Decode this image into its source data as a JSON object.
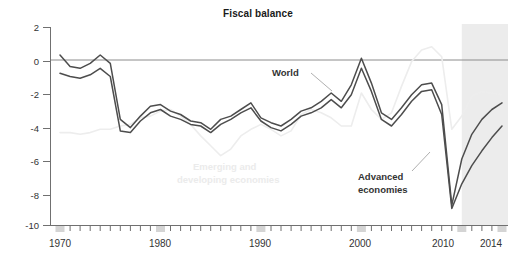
{
  "chart_data": {
    "type": "line",
    "title": "Fiscal balance",
    "xlabel": "",
    "ylabel": "",
    "xlim": [
      1969,
      2014.6
    ],
    "ylim": [
      -10,
      2
    ],
    "yticks": [
      2,
      0,
      -2,
      -4,
      -6,
      -8,
      -10
    ],
    "ytick_labels": [
      "2",
      "0",
      "-2",
      "-4",
      "-6",
      "-8",
      "-10"
    ],
    "xticks": [
      1970,
      1980,
      1990,
      2000,
      2010,
      2014
    ],
    "xtick_labels": [
      "1970",
      "1980",
      "1990",
      "2000",
      "2010",
      "2014"
    ],
    "minor_tick_interval": 1,
    "grid": false,
    "legend_position": "inline-annotations",
    "zero_line": 0,
    "projection_start": 2010,
    "projection_end": 2014.6,
    "projection_shading": "#ececec",
    "colors": {
      "world": "#4d4d4d",
      "advanced": "#4d4d4d",
      "emerging": "#ededed",
      "axis": "#707070",
      "zero_line": "#8c8c8c",
      "projection_band": "#ececec",
      "text": "#333333"
    },
    "x": [
      1970,
      1971,
      1972,
      1973,
      1974,
      1975,
      1976,
      1977,
      1978,
      1979,
      1980,
      1981,
      1982,
      1983,
      1984,
      1985,
      1986,
      1987,
      1988,
      1989,
      1990,
      1991,
      1992,
      1993,
      1994,
      1995,
      1996,
      1997,
      1998,
      1999,
      2000,
      2001,
      2002,
      2003,
      2004,
      2005,
      2006,
      2007,
      2008,
      2009,
      2010,
      2011,
      2012,
      2013,
      2014
    ],
    "series": [
      {
        "name": "World",
        "label": "World",
        "color": "#4d4d4d",
        "values": [
          0.3,
          -0.4,
          -0.5,
          -0.2,
          0.3,
          -0.2,
          -3.6,
          -4.1,
          -3.4,
          -2.8,
          -2.7,
          -3.1,
          -3.3,
          -3.7,
          -3.8,
          -4.2,
          -3.6,
          -3.4,
          -3.0,
          -2.6,
          -3.5,
          -3.8,
          -4.0,
          -3.6,
          -3.1,
          -2.9,
          -2.5,
          -2.0,
          -2.5,
          -1.5,
          0.1,
          -1.4,
          -3.2,
          -3.6,
          -2.9,
          -2.1,
          -1.5,
          -1.4,
          -2.7,
          -8.8,
          -6.0,
          -4.5,
          -3.6,
          -3.0,
          -2.6
        ]
      },
      {
        "name": "Advanced economies",
        "label": "Advanced\neconomies",
        "color": "#4d4d4d",
        "values": [
          -0.8,
          -1.0,
          -1.1,
          -0.9,
          -0.5,
          -1.0,
          -4.3,
          -4.4,
          -3.7,
          -3.2,
          -3.0,
          -3.4,
          -3.6,
          -3.9,
          -4.0,
          -4.4,
          -3.9,
          -3.6,
          -3.2,
          -2.9,
          -3.7,
          -4.1,
          -4.3,
          -3.9,
          -3.4,
          -3.2,
          -2.9,
          -2.4,
          -2.9,
          -2.1,
          -0.5,
          -1.9,
          -3.6,
          -4.0,
          -3.3,
          -2.5,
          -1.9,
          -1.8,
          -3.3,
          -9.0,
          -7.5,
          -6.4,
          -5.5,
          -4.7,
          -4.0
        ]
      },
      {
        "name": "Emerging and developing economies",
        "label": "Emerging and\ndeveloping economies",
        "color": "#ededed",
        "values": [
          -4.4,
          -4.4,
          -4.5,
          -4.4,
          -4.2,
          -4.2,
          -4.0,
          -3.9,
          -3.5,
          -3.4,
          -3.1,
          -3.0,
          -3.4,
          -3.9,
          -4.6,
          -5.2,
          -5.8,
          -5.4,
          -4.6,
          -4.2,
          -3.9,
          -4.2,
          -4.6,
          -4.3,
          -3.3,
          -3.0,
          -3.2,
          -3.5,
          -4.0,
          -4.0,
          -2.0,
          -3.0,
          -3.6,
          -3.2,
          -1.6,
          -0.1,
          0.6,
          0.8,
          0.2,
          -4.2,
          -3.4,
          -2.2,
          -1.9,
          -2.0,
          -2.1
        ]
      }
    ],
    "annotations": [
      {
        "text": "World",
        "x": 2000.4,
        "y": -1.2,
        "style": "dark"
      },
      {
        "text": "Advanced economies",
        "x": 2005.0,
        "y": -7.2,
        "style": "dark"
      },
      {
        "text": "Emerging and developing economies",
        "x": 1986.0,
        "y": -6.4,
        "style": "faint"
      }
    ]
  }
}
